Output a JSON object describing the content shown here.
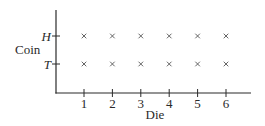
{
  "chart_data": {
    "type": "scatter",
    "title": "",
    "xlabel": "Die",
    "ylabel": "Coin",
    "x_ticks": [
      "1",
      "2",
      "3",
      "4",
      "5",
      "6"
    ],
    "y_ticks": [
      "T",
      "H"
    ],
    "xlim": [
      0,
      7
    ],
    "grid": false,
    "legend": null,
    "marker": "x",
    "points": [
      {
        "x": 1,
        "y": "H"
      },
      {
        "x": 2,
        "y": "H"
      },
      {
        "x": 3,
        "y": "H"
      },
      {
        "x": 4,
        "y": "H"
      },
      {
        "x": 5,
        "y": "H"
      },
      {
        "x": 6,
        "y": "H"
      },
      {
        "x": 1,
        "y": "T"
      },
      {
        "x": 2,
        "y": "T"
      },
      {
        "x": 3,
        "y": "T"
      },
      {
        "x": 4,
        "y": "T"
      },
      {
        "x": 5,
        "y": "T"
      },
      {
        "x": 6,
        "y": "T"
      }
    ]
  },
  "colors": {
    "axis": "#2a2a2a",
    "marker": "#555555"
  }
}
